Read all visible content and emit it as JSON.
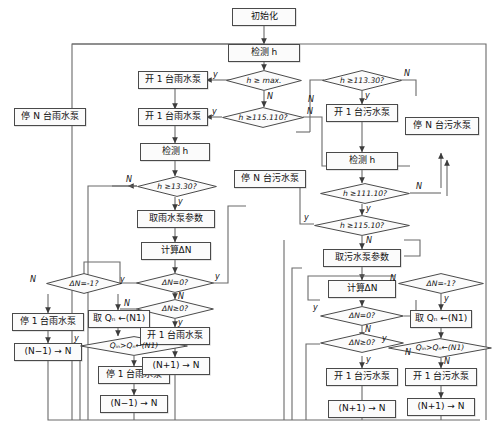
{
  "diagram": {
    "type": "flowchart",
    "stroke_color": "#4a4a4a",
    "fill_color": "#fbfbfb",
    "text_color": "#111111"
  },
  "nodes": {
    "start": "初始化",
    "detect_h_top": "检测 h",
    "d_hmax": "h ≥ max.",
    "d_h115110": "h ≥115.110?",
    "open1_rain_a": "开 1 台雨水泵",
    "open1_rain_b": "开 1 台雨水泵",
    "stop_n_rain": "停 N 台雨水泵",
    "detect_h_left": "检测 h",
    "d_h11330_left": "h ≥13.30?",
    "get_rain_param": "取雨水泵参数",
    "calc_dn_left": "计算ΔN",
    "d_dn0_left": "ΔN=0?",
    "d_dnge0_left": "ΔN≥0?",
    "d_dn_neg1_left": "ΔN=-1?",
    "stop1_rain_a": "停 1 台雨水泵",
    "nm1_left_a": "(N−1) → N",
    "get_qn_left": "取 Qₙ ←(N1)",
    "d_qin_left": "Qᵢₙ>Qₙ←(N1)",
    "stop1_rain_b": "停 1 台雨水泵",
    "nm1_left_b": "(N−1) → N",
    "open1_rain_c": "开 1 台雨水泵",
    "np1_left": "(N+1) → N",
    "d_h11330_right": "h ≥113.30?",
    "open1_sew_a": "开 1 台污水泵",
    "detect_h_right": "检测 h",
    "d_h11110": "h ≥111.10?",
    "d_h11510": "h ≥115.10?",
    "stop_n_sew_mid": "停 N 台污水泵",
    "stop_n_sew_right": "停 N 台污水泵",
    "get_sew_param": "取污水泵参数",
    "calc_dn_right": "计算ΔN",
    "d_dn0_right": "ΔN=0?",
    "d_dnge0_right": "ΔN≥0?",
    "d_dn_neg1_right": "ΔN=-1?",
    "open1_sew_b": "开 1 台污水泵",
    "np1_right_a": "(N+1) → N",
    "get_qn_right": "取 Qₙ ←(N1)",
    "d_qin_right": "Qᵢₙ>Qₙ←(N1)",
    "open1_sew_c": "开 1 台污水泵",
    "np1_right_b": "(N+1) → N"
  },
  "edge_labels": {
    "y1": "y",
    "n1": "N",
    "y2": "y",
    "n2": "N",
    "y3": "y",
    "n3": "N",
    "y4": "y",
    "n4": "N",
    "y5": "y",
    "n5": "N",
    "y6": "y",
    "n6": "N",
    "y7": "y",
    "n7": "N",
    "y8": "y",
    "n8": "N",
    "y9": "y",
    "n9": "N",
    "y10": "y",
    "n10": "N",
    "y11": "y",
    "n11": "N",
    "y12": "y",
    "n12": "N",
    "y13": "y",
    "n13": "N",
    "y14": "y",
    "n14": "N"
  }
}
